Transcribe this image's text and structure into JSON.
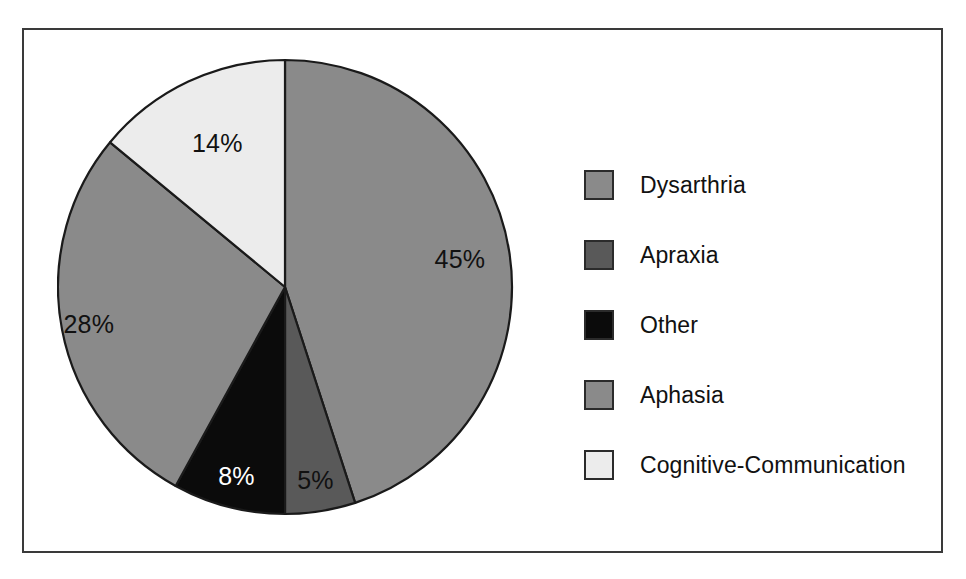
{
  "figure": {
    "background_color": "#ffffff",
    "frame_color": "#3a3a3a"
  },
  "chart_data": {
    "type": "pie",
    "title": "",
    "subtitle": "",
    "xlabel": "",
    "ylabel": "",
    "grid": false,
    "legend_position": "right",
    "start_angle_deg": 0,
    "direction": "clockwise",
    "units": "percent",
    "categories": [
      "Dysarthria",
      "Apraxia",
      "Other",
      "Aphasia",
      "Cognitive-Communication"
    ],
    "values": [
      45,
      5,
      8,
      28,
      14
    ],
    "data_labels": [
      "45%",
      "5%",
      "8%",
      "28%",
      "14%"
    ],
    "colors": [
      "#8a8a8a",
      "#595959",
      "#0b0b0b",
      "#8a8a8a",
      "#ececec"
    ],
    "label_text_colors": [
      "#111111",
      "#111111",
      "#ffffff",
      "#111111",
      "#111111"
    ],
    "slices": [
      {
        "label": "Dysarthria",
        "value": 45,
        "display": "45%",
        "color": "#8a8a8a",
        "label_color": "#111111",
        "start_deg": 0,
        "end_deg": 162
      },
      {
        "label": "Apraxia",
        "value": 5,
        "display": "5%",
        "color": "#595959",
        "label_color": "#111111",
        "start_deg": 162,
        "end_deg": 180
      },
      {
        "label": "Other",
        "value": 8,
        "display": "8%",
        "color": "#0b0b0b",
        "label_color": "#ffffff",
        "start_deg": 180,
        "end_deg": 208.8
      },
      {
        "label": "Aphasia",
        "value": 28,
        "display": "28%",
        "color": "#8a8a8a",
        "label_color": "#111111",
        "start_deg": 208.8,
        "end_deg": 309.6
      },
      {
        "label": "Cognitive-Communication",
        "value": 14,
        "display": "14%",
        "color": "#ececec",
        "label_color": "#111111",
        "start_deg": 309.6,
        "end_deg": 360
      }
    ],
    "legend": [
      {
        "label": "Dysarthria",
        "color": "#8a8a8a"
      },
      {
        "label": "Apraxia",
        "color": "#595959"
      },
      {
        "label": "Other",
        "color": "#0b0b0b"
      },
      {
        "label": "Aphasia",
        "color": "#8a8a8a"
      },
      {
        "label": "Cognitive-Communication",
        "color": "#ececec"
      }
    ]
  }
}
